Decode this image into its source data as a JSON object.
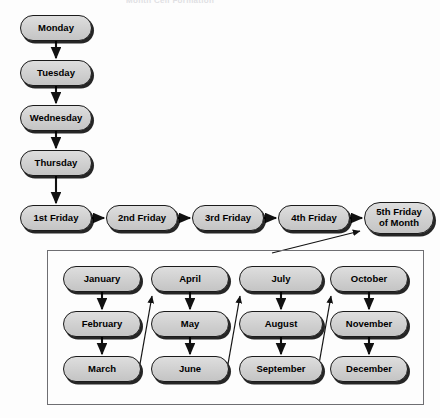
{
  "diagram": {
    "title_fragment": "Month Cell Formation",
    "node_fill": "#d2d2d2",
    "node_border": "#1b1b1b",
    "box_border": "#6e6e72",
    "weekday_chain": [
      {
        "label": "Monday",
        "x": 20,
        "y": 15,
        "w": 72,
        "h": 26
      },
      {
        "label": "Tuesday",
        "x": 20,
        "y": 60,
        "w": 72,
        "h": 26
      },
      {
        "label": "Wednesday",
        "x": 20,
        "y": 105,
        "w": 72,
        "h": 26
      },
      {
        "label": "Thursday",
        "x": 20,
        "y": 150,
        "w": 72,
        "h": 26
      }
    ],
    "friday_chain": [
      {
        "label": "1st Friday",
        "line2": "",
        "x": 20,
        "y": 205,
        "w": 72,
        "h": 26
      },
      {
        "label": "2nd Friday",
        "line2": "",
        "x": 106,
        "y": 205,
        "w": 72,
        "h": 26
      },
      {
        "label": "3rd Friday",
        "line2": "",
        "x": 192,
        "y": 205,
        "w": 72,
        "h": 26
      },
      {
        "label": "4th Friday",
        "line2": "",
        "x": 278,
        "y": 205,
        "w": 72,
        "h": 26
      },
      {
        "label": "5th Friday",
        "line2": "of Month",
        "x": 364,
        "y": 202,
        "w": 70,
        "h": 32
      }
    ],
    "month_box": {
      "x": 47,
      "y": 250,
      "w": 377,
      "h": 155
    },
    "month_columns": [
      {
        "column": 1,
        "months": [
          {
            "label": "January",
            "x": 63,
            "y": 266,
            "w": 78,
            "h": 26
          },
          {
            "label": "February",
            "x": 63,
            "y": 311,
            "w": 78,
            "h": 26
          },
          {
            "label": "March",
            "x": 63,
            "y": 356,
            "w": 78,
            "h": 26
          }
        ]
      },
      {
        "column": 2,
        "months": [
          {
            "label": "April",
            "x": 151,
            "y": 266,
            "w": 78,
            "h": 26
          },
          {
            "label": "May",
            "x": 151,
            "y": 311,
            "w": 78,
            "h": 26
          },
          {
            "label": "June",
            "x": 151,
            "y": 356,
            "w": 78,
            "h": 26
          }
        ]
      },
      {
        "column": 3,
        "months": [
          {
            "label": "July",
            "x": 239,
            "y": 266,
            "w": 84,
            "h": 26
          },
          {
            "label": "August",
            "x": 239,
            "y": 311,
            "w": 84,
            "h": 26
          },
          {
            "label": "September",
            "x": 239,
            "y": 356,
            "w": 84,
            "h": 26
          }
        ]
      },
      {
        "column": 4,
        "months": [
          {
            "label": "October",
            "x": 330,
            "y": 266,
            "w": 78,
            "h": 26
          },
          {
            "label": "November",
            "x": 330,
            "y": 311,
            "w": 78,
            "h": 26
          },
          {
            "label": "December",
            "x": 330,
            "y": 356,
            "w": 78,
            "h": 26
          }
        ]
      }
    ],
    "connectors": {
      "vertical_weekday": [
        {
          "from": "Monday",
          "to": "Tuesday",
          "x": 56,
          "y1": 41,
          "y2": 60
        },
        {
          "from": "Tuesday",
          "to": "Wednesday",
          "x": 56,
          "y1": 86,
          "y2": 105
        },
        {
          "from": "Wednesday",
          "to": "Thursday",
          "x": 56,
          "y1": 131,
          "y2": 150
        },
        {
          "from": "Thursday",
          "to": "1st Friday",
          "x": 56,
          "y1": 176,
          "y2": 205
        }
      ],
      "horizontal_friday": [
        {
          "from": "1st Friday",
          "to": "2nd Friday",
          "y": 218,
          "x1": 92,
          "x2": 106
        },
        {
          "from": "2nd Friday",
          "to": "3rd Friday",
          "y": 218,
          "x1": 178,
          "x2": 192
        },
        {
          "from": "3rd Friday",
          "to": "4th Friday",
          "y": 218,
          "x1": 264,
          "x2": 278
        },
        {
          "from": "4th Friday",
          "to": "5th Friday",
          "y": 218,
          "x1": 350,
          "x2": 364
        }
      ],
      "vertical_month": [
        {
          "from": "January",
          "to": "February",
          "x": 102,
          "y1": 292,
          "y2": 311
        },
        {
          "from": "February",
          "to": "March",
          "x": 102,
          "y1": 337,
          "y2": 356
        },
        {
          "from": "April",
          "to": "May",
          "x": 190,
          "y1": 292,
          "y2": 311
        },
        {
          "from": "May",
          "to": "June",
          "x": 190,
          "y1": 337,
          "y2": 356
        },
        {
          "from": "July",
          "to": "August",
          "x": 281,
          "y1": 292,
          "y2": 311
        },
        {
          "from": "August",
          "to": "September",
          "x": 281,
          "y1": 337,
          "y2": 356
        },
        {
          "from": "October",
          "to": "November",
          "x": 369,
          "y1": 292,
          "y2": 311
        },
        {
          "from": "November",
          "to": "December",
          "x": 369,
          "y1": 337,
          "y2": 356
        }
      ],
      "diagonal_wrap": [
        {
          "from": "March",
          "to": "April",
          "x1": 139,
          "y1": 362,
          "x2": 153,
          "y2": 295
        },
        {
          "from": "June",
          "to": "July",
          "x1": 227,
          "y1": 362,
          "x2": 241,
          "y2": 295
        },
        {
          "from": "September",
          "to": "October",
          "x1": 318,
          "y1": 362,
          "x2": 332,
          "y2": 295
        }
      ],
      "box_to_fifth_friday": {
        "from": "month-box",
        "to": "5th Friday of Month",
        "x1": 275,
        "y1": 252,
        "x2": 362,
        "y2": 231
      }
    }
  }
}
